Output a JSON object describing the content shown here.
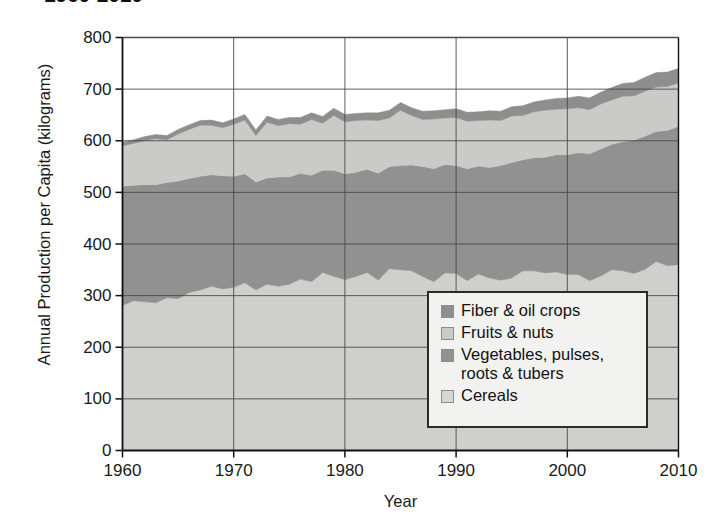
{
  "chart_data": {
    "type": "area",
    "title": "1960-2010",
    "xlabel": "Year",
    "ylabel": "Annual Production per Capita (kilograms)",
    "xlim": [
      1960,
      2010
    ],
    "ylim": [
      0,
      800
    ],
    "xticks": [
      1960,
      1970,
      1980,
      1990,
      2000,
      2010
    ],
    "yticks": [
      0,
      100,
      200,
      300,
      400,
      500,
      600,
      700,
      800
    ],
    "grid": "both",
    "legend_position": "inside-lower-right",
    "stacked": true,
    "stack_order_bottom_to_top": [
      "Cereals",
      "Vegetables, pulses, roots & tubers",
      "Fruits & nuts",
      "Fiber & oil crops"
    ],
    "x": [
      1960,
      1961,
      1962,
      1963,
      1964,
      1965,
      1966,
      1967,
      1968,
      1969,
      1970,
      1971,
      1972,
      1973,
      1974,
      1975,
      1976,
      1977,
      1978,
      1979,
      1980,
      1981,
      1982,
      1983,
      1984,
      1985,
      1986,
      1987,
      1988,
      1989,
      1990,
      1991,
      1992,
      1993,
      1994,
      1995,
      1996,
      1997,
      1998,
      1999,
      2000,
      2001,
      2002,
      2003,
      2004,
      2005,
      2006,
      2007,
      2008,
      2009,
      2010
    ],
    "series": [
      {
        "name": "Cereals",
        "color": "#cfcfcb",
        "values": [
          281,
          290,
          288,
          286,
          296,
          294,
          306,
          311,
          318,
          313,
          316,
          325,
          311,
          322,
          318,
          322,
          332,
          327,
          345,
          337,
          331,
          337,
          345,
          330,
          352,
          350,
          348,
          337,
          327,
          344,
          343,
          329,
          342,
          334,
          330,
          334,
          348,
          348,
          344,
          346,
          341,
          341,
          329,
          338,
          350,
          348,
          343,
          351,
          366,
          358,
          360
        ]
      },
      {
        "name": "Vegetables, pulses, roots & tubers",
        "color": "#919191",
        "values": [
          231,
          224,
          227,
          229,
          223,
          228,
          221,
          220,
          216,
          219,
          215,
          211,
          209,
          206,
          212,
          208,
          205,
          206,
          198,
          206,
          205,
          202,
          200,
          207,
          198,
          202,
          205,
          213,
          219,
          210,
          209,
          217,
          209,
          214,
          222,
          224,
          215,
          219,
          224,
          227,
          232,
          236,
          246,
          246,
          243,
          250,
          258,
          258,
          252,
          262,
          268
        ]
      },
      {
        "name": "Fruits & nuts",
        "color": "#cacac6",
        "values": [
          78,
          81,
          85,
          89,
          83,
          91,
          95,
          99,
          96,
          93,
          101,
          104,
          90,
          108,
          99,
          103,
          95,
          108,
          91,
          106,
          101,
          100,
          95,
          102,
          94,
          107,
          96,
          91,
          96,
          90,
          93,
          92,
          88,
          92,
          87,
          90,
          86,
          89,
          91,
          88,
          89,
          87,
          85,
          87,
          86,
          88,
          86,
          87,
          86,
          85,
          84
        ]
      },
      {
        "name": "Fiber & oil crops",
        "color": "#8e8e8e",
        "values": [
          7,
          7,
          8,
          8,
          8,
          9,
          9,
          9,
          10,
          10,
          10,
          11,
          11,
          12,
          12,
          12,
          13,
          13,
          13,
          14,
          14,
          14,
          14,
          15,
          15,
          15,
          15,
          16,
          16,
          16,
          17,
          17,
          17,
          18,
          18,
          18,
          19,
          19,
          20,
          21,
          21,
          22,
          23,
          23,
          24,
          25,
          26,
          27,
          28,
          28,
          28
        ]
      }
    ]
  },
  "legend": {
    "items": [
      {
        "label": "Fiber & oil crops",
        "color": "#8e8e8e"
      },
      {
        "label": "Fruits & nuts",
        "color": "#cacac6"
      },
      {
        "label": "Vegetables, pulses,\nroots & tubers",
        "color": "#919191"
      },
      {
        "label": "Cereals",
        "color": "#d6d6d2"
      }
    ]
  }
}
